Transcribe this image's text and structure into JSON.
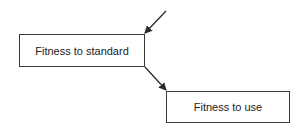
{
  "diagram": {
    "nodes": [
      {
        "id": "standard",
        "label": "Fitness to standard"
      },
      {
        "id": "use",
        "label": "Fitness to use"
      }
    ],
    "edges": [
      {
        "from": "external",
        "to": "standard"
      },
      {
        "from": "standard",
        "to": "use"
      }
    ],
    "colors": {
      "stroke": "#3a3a3a",
      "text": "#222222",
      "background": "#ffffff"
    }
  }
}
